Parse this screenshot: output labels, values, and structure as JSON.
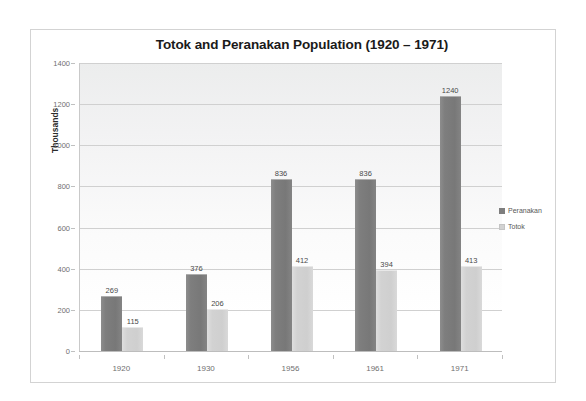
{
  "chart_data": {
    "type": "bar",
    "title": "Totok and Peranakan Population (1920 – 1971)",
    "xlabel": "",
    "ylabel": "Thousands",
    "ylim": [
      0,
      1400
    ],
    "y_ticks": [
      0,
      200,
      400,
      600,
      800,
      1000,
      1200,
      1400
    ],
    "grid": true,
    "legend_position": "right",
    "categories": [
      "1920",
      "1930",
      "1956",
      "1961",
      "1971"
    ],
    "series": [
      {
        "name": "Peranakan",
        "color": "#7e7e7e",
        "values": [
          269,
          376,
          836,
          836,
          1240
        ]
      },
      {
        "name": "Totok",
        "color": "#d2d2d2",
        "values": [
          115,
          206,
          412,
          394,
          413
        ]
      }
    ]
  },
  "legend": {
    "items": [
      {
        "label": "Peranakan"
      },
      {
        "label": "Totok"
      }
    ]
  }
}
